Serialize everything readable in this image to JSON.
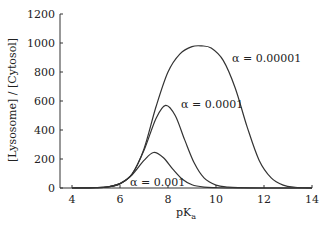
{
  "chart_data": {
    "type": "line",
    "title": "",
    "xlabel": "pKa",
    "ylabel": "[Lysosome] / [Cytosol]",
    "xlim": [
      3.5,
      14
    ],
    "ylim": [
      0,
      1200
    ],
    "xticks": [
      4,
      6,
      8,
      10,
      12,
      14
    ],
    "yticks": [
      0,
      200,
      400,
      600,
      800,
      1000,
      1200
    ],
    "grid": false,
    "legend": "inline annotations",
    "series": [
      {
        "name": "α = 0.001",
        "peak_x": 7.4,
        "peak_y": 245,
        "x": [
          4,
          5,
          5.5,
          6,
          6.5,
          7,
          7.4,
          7.8,
          8.2,
          8.6,
          9,
          9.5,
          10,
          11,
          14
        ],
        "y": [
          0,
          2,
          8,
          30,
          90,
          190,
          245,
          210,
          130,
          60,
          22,
          6,
          2,
          0,
          0
        ]
      },
      {
        "name": "α = 0.0001",
        "peak_x": 7.9,
        "peak_y": 570,
        "x": [
          4,
          5,
          5.5,
          6,
          6.5,
          7,
          7.5,
          7.9,
          8.3,
          8.7,
          9.1,
          9.5,
          10,
          10.5,
          11,
          12,
          14
        ],
        "y": [
          0,
          2,
          8,
          30,
          95,
          260,
          480,
          570,
          500,
          330,
          170,
          70,
          20,
          6,
          2,
          0,
          0
        ]
      },
      {
        "name": "α = 0.00001",
        "peak_x": 9.4,
        "peak_y": 980,
        "x": [
          4,
          5,
          5.5,
          6,
          6.5,
          7,
          7.5,
          8,
          8.5,
          9,
          9.4,
          9.8,
          10.3,
          10.8,
          11.3,
          11.8,
          12.3,
          12.8,
          13.3,
          14
        ],
        "y": [
          0,
          2,
          8,
          30,
          95,
          270,
          560,
          800,
          925,
          975,
          980,
          965,
          880,
          690,
          420,
          190,
          70,
          20,
          5,
          0
        ]
      }
    ],
    "annotations": [
      {
        "text_prefix": "α",
        "text_value": "= 0.001",
        "x": 6.6,
        "y": 25
      },
      {
        "text_prefix": "α",
        "text_value": "= 0.0001",
        "x": 8.1,
        "y": 560
      },
      {
        "text_prefix": "α",
        "text_value": "= 0.00001",
        "x": 10.9,
        "y": 800
      }
    ]
  },
  "labels": {
    "ylabel": "[Lysosome] / [Cytosol]",
    "xlabel_main": "pK",
    "xlabel_sub": "a",
    "ann1": "α = 0.001",
    "ann2": "α = 0.0001",
    "ann3": "α = 0.00001"
  }
}
